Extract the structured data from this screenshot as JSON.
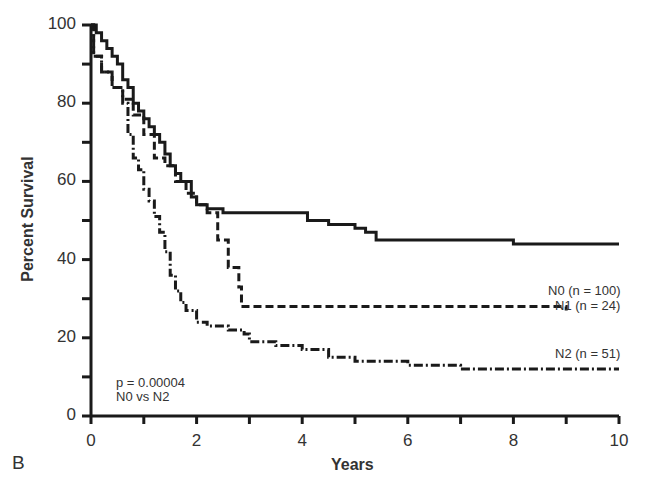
{
  "panel_label": "B",
  "chart_data": {
    "type": "line",
    "subtype": "kaplan-meier step",
    "title": "",
    "xlabel": "Years",
    "ylabel": "Percent Survival",
    "xlim": [
      0,
      10
    ],
    "ylim": [
      0,
      100
    ],
    "x_ticks": [
      "0",
      "2",
      "4",
      "6",
      "8",
      "10"
    ],
    "x_minor_ticks": [
      1,
      3,
      5,
      7,
      9
    ],
    "y_ticks": [
      "0",
      "20",
      "40",
      "60",
      "80",
      "100"
    ],
    "y_minor_ticks": [
      10,
      30,
      50,
      70,
      90
    ],
    "grid": false,
    "legend_position": "inline-right",
    "series": [
      {
        "name": "N0 (n = 100)",
        "style": "solid",
        "x": [
          0,
          0.1,
          0.2,
          0.3,
          0.4,
          0.5,
          0.6,
          0.7,
          0.8,
          0.9,
          1.0,
          1.1,
          1.2,
          1.3,
          1.4,
          1.5,
          1.6,
          1.7,
          1.8,
          1.9,
          2.0,
          2.2,
          2.5,
          3.0,
          3.5,
          3.9,
          4.1,
          4.5,
          4.8,
          5.0,
          5.2,
          5.3,
          5.4,
          6,
          7,
          8,
          9,
          10
        ],
        "values": [
          100,
          98,
          96,
          94,
          92,
          90,
          86,
          84,
          80,
          78,
          76,
          74,
          72,
          70,
          67,
          64,
          62,
          60,
          60,
          56,
          54,
          53,
          52,
          52,
          52,
          52,
          50,
          49,
          49,
          48,
          47,
          47,
          45,
          45,
          45,
          44,
          44,
          44
        ]
      },
      {
        "name": "N1 (n = 24)",
        "style": "dashed",
        "x": [
          0,
          0.05,
          0.2,
          0.4,
          0.6,
          0.8,
          1.0,
          1.2,
          1.4,
          1.6,
          1.8,
          2.0,
          2.2,
          2.4,
          2.6,
          2.8,
          2.85,
          3.0,
          5,
          7,
          9
        ],
        "values": [
          100,
          92,
          88,
          84,
          81,
          77,
          72,
          66,
          64,
          60,
          57,
          54,
          52,
          45,
          38,
          33,
          28,
          28,
          28,
          28,
          27
        ]
      },
      {
        "name": "N2 (n = 51)",
        "style": "dash-dot",
        "x": [
          0,
          0.05,
          0.2,
          0.4,
          0.6,
          0.7,
          0.8,
          0.9,
          1.0,
          1.1,
          1.2,
          1.3,
          1.4,
          1.5,
          1.6,
          1.7,
          1.8,
          2.0,
          2.2,
          2.6,
          2.9,
          3.0,
          3.5,
          4.0,
          4.5,
          5,
          6,
          7,
          8,
          9,
          10
        ],
        "values": [
          100,
          92,
          88,
          84,
          80,
          72,
          66,
          63,
          58,
          55,
          51,
          47,
          42,
          36,
          32,
          29,
          27,
          24,
          23,
          22,
          21,
          19,
          18,
          17,
          15,
          14,
          13,
          12,
          12,
          12,
          12
        ]
      }
    ],
    "annotations": [
      "p = 0.00004",
      "N0 vs N2"
    ]
  }
}
